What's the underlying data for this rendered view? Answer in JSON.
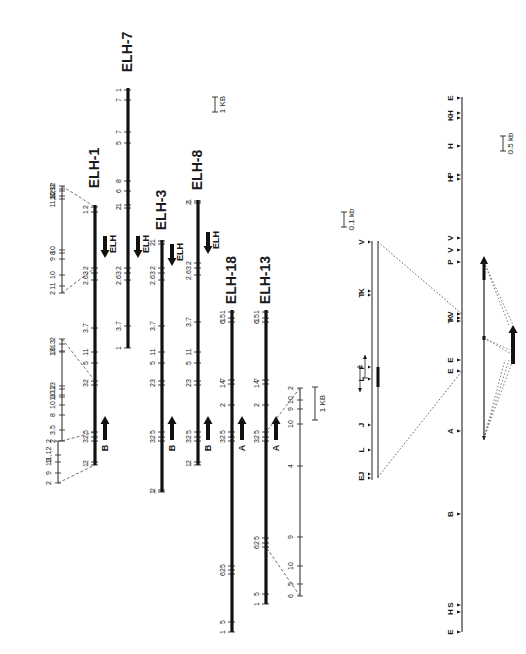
{
  "clones": [
    {
      "name": "ELH-1",
      "x": 95,
      "y1": 205,
      "y2": 465,
      "label_y": 168,
      "ticks": [
        {
          "y": 207,
          "t": "2"
        },
        {
          "y": 212,
          "t": "1"
        },
        {
          "y": 268,
          "t": "2"
        },
        {
          "y": 273,
          "t": "3"
        },
        {
          "y": 280,
          "t": "2.6"
        },
        {
          "y": 328,
          "t": "3.7"
        },
        {
          "y": 352,
          "t": "11"
        },
        {
          "y": 363,
          "t": "5"
        },
        {
          "y": 381,
          "t": "2"
        },
        {
          "y": 385,
          "t": "3"
        },
        {
          "y": 432,
          "t": "5"
        },
        {
          "y": 437,
          "t": "2"
        },
        {
          "y": 441,
          "t": "3"
        },
        {
          "y": 462,
          "t": "2"
        },
        {
          "y": 465,
          "t": "1"
        }
      ],
      "arrows": [
        {
          "y": 236,
          "label": "ELH",
          "dir": "down"
        },
        {
          "y": 438,
          "label": "B",
          "dir": "up"
        }
      ]
    },
    {
      "name": "ELH-7",
      "x": 128,
      "y1": 88,
      "y2": 348,
      "label_y": 52,
      "ticks": [
        {
          "y": 90,
          "t": "1"
        },
        {
          "y": 100,
          "t": "7"
        },
        {
          "y": 132,
          "t": "7"
        },
        {
          "y": 143,
          "t": "5"
        },
        {
          "y": 181,
          "t": "8"
        },
        {
          "y": 191,
          "t": "6"
        },
        {
          "y": 205,
          "t": "1"
        },
        {
          "y": 208,
          "t": "2"
        },
        {
          "y": 268,
          "t": "2"
        },
        {
          "y": 273,
          "t": "3"
        },
        {
          "y": 280,
          "t": "2.6"
        },
        {
          "y": 326,
          "t": "3.7"
        },
        {
          "y": 348,
          "t": "1"
        }
      ],
      "arrows": [
        {
          "y": 236,
          "label": "ELH",
          "dir": "down"
        }
      ]
    },
    {
      "name": "ELH-3",
      "x": 162,
      "y1": 240,
      "y2": 492,
      "label_y": 210,
      "ticks": [
        {
          "y": 241,
          "t": "1"
        },
        {
          "y": 244,
          "t": "2"
        },
        {
          "y": 268,
          "t": "2"
        },
        {
          "y": 273,
          "t": "3"
        },
        {
          "y": 280,
          "t": "2.6"
        },
        {
          "y": 326,
          "t": "3.7"
        },
        {
          "y": 352,
          "t": "11"
        },
        {
          "y": 363,
          "t": "5"
        },
        {
          "y": 381,
          "t": "3"
        },
        {
          "y": 385,
          "t": "2"
        },
        {
          "y": 432,
          "t": "5"
        },
        {
          "y": 437,
          "t": "2"
        },
        {
          "y": 441,
          "t": "3"
        },
        {
          "y": 490,
          "t": "2"
        },
        {
          "y": 492,
          "t": "1"
        }
      ],
      "arrows": [
        {
          "y": 244,
          "label": "ELH",
          "dir": "down"
        },
        {
          "y": 438,
          "label": "B",
          "dir": "up"
        }
      ]
    },
    {
      "name": "ELH-8",
      "x": 198,
      "y1": 200,
      "y2": 465,
      "label_y": 170,
      "ticks": [
        {
          "y": 201,
          "t": "1"
        },
        {
          "y": 203,
          "t": "2"
        },
        {
          "y": 263,
          "t": "2"
        },
        {
          "y": 268,
          "t": "3"
        },
        {
          "y": 275,
          "t": "2.6"
        },
        {
          "y": 322,
          "t": "3.7"
        },
        {
          "y": 352,
          "t": "11"
        },
        {
          "y": 363,
          "t": "5"
        },
        {
          "y": 381,
          "t": "3"
        },
        {
          "y": 385,
          "t": "2"
        },
        {
          "y": 432,
          "t": "5"
        },
        {
          "y": 437,
          "t": "2"
        },
        {
          "y": 441,
          "t": "3"
        },
        {
          "y": 462,
          "t": "2"
        },
        {
          "y": 465,
          "t": "1"
        }
      ],
      "arrows": [
        {
          "y": 232,
          "label": "ELH",
          "dir": "down"
        },
        {
          "y": 438,
          "label": "B",
          "dir": "up"
        }
      ]
    },
    {
      "name": "ELH-18",
      "x": 232,
      "y1": 310,
      "y2": 632,
      "label_y": 280,
      "ticks": [
        {
          "y": 312,
          "t": "1"
        },
        {
          "y": 318,
          "t": "15"
        },
        {
          "y": 322,
          "t": "6"
        },
        {
          "y": 380,
          "t": "7"
        },
        {
          "y": 384,
          "t": "14"
        },
        {
          "y": 405,
          "t": "2"
        },
        {
          "y": 432,
          "t": "5"
        },
        {
          "y": 437,
          "t": "2"
        },
        {
          "y": 441,
          "t": "3"
        },
        {
          "y": 566,
          "t": "5"
        },
        {
          "y": 570,
          "t": "2"
        },
        {
          "y": 574,
          "t": "6"
        },
        {
          "y": 622,
          "t": "5"
        },
        {
          "y": 632,
          "t": "1"
        }
      ],
      "arrows": [
        {
          "y": 438,
          "label": "A",
          "dir": "up"
        }
      ]
    },
    {
      "name": "ELH-13",
      "x": 266,
      "y1": 310,
      "y2": 604,
      "label_y": 280,
      "ticks": [
        {
          "y": 312,
          "t": "1"
        },
        {
          "y": 318,
          "t": "15"
        },
        {
          "y": 322,
          "t": "6"
        },
        {
          "y": 380,
          "t": "7"
        },
        {
          "y": 384,
          "t": "14"
        },
        {
          "y": 405,
          "t": "2"
        },
        {
          "y": 432,
          "t": "5"
        },
        {
          "y": 437,
          "t": "2"
        },
        {
          "y": 441,
          "t": "3"
        },
        {
          "y": 538,
          "t": "5"
        },
        {
          "y": 543,
          "t": "2"
        },
        {
          "y": 547,
          "t": "6"
        },
        {
          "y": 594,
          "t": "5"
        },
        {
          "y": 604,
          "t": "1"
        }
      ],
      "arrows": [
        {
          "y": 438,
          "label": "A",
          "dir": "up"
        }
      ]
    }
  ],
  "expansions": [
    {
      "name": "ELH-1-top-expansion",
      "x": 62,
      "y1": 186,
      "y2": 293,
      "ticks": [
        {
          "y": 186,
          "t": "2"
        },
        {
          "y": 189,
          "t": "9"
        },
        {
          "y": 191,
          "t": "11,12"
        },
        {
          "y": 196,
          "t": "10"
        },
        {
          "y": 199,
          "t": "11,12"
        },
        {
          "y": 250,
          "t": "10"
        },
        {
          "y": 253,
          "t": "8"
        },
        {
          "y": 259,
          "t": "9"
        },
        {
          "y": 275,
          "t": "10"
        },
        {
          "y": 286,
          "t": "11"
        },
        {
          "y": 293,
          "t": "2"
        }
      ],
      "links": [
        [
          186,
          95,
          207
        ],
        [
          293,
          95,
          268
        ]
      ]
    },
    {
      "name": "ELH-1-bottom-expansion-a",
      "x": 62,
      "y1": 339,
      "y2": 441,
      "ticks": [
        {
          "y": 339,
          "t": "2"
        },
        {
          "y": 344,
          "t": "13"
        },
        {
          "y": 351,
          "t": "10"
        },
        {
          "y": 352,
          "t": "13"
        },
        {
          "y": 386,
          "t": "13"
        },
        {
          "y": 389,
          "t": "12"
        },
        {
          "y": 395,
          "t": "10"
        },
        {
          "y": 397,
          "t": "11"
        },
        {
          "y": 405,
          "t": "10"
        },
        {
          "y": 415,
          "t": "8"
        },
        {
          "y": 430,
          "t": "3.5"
        },
        {
          "y": 441,
          "t": "2"
        }
      ],
      "links": [
        [
          339,
          95,
          381
        ],
        [
          441,
          95,
          432
        ]
      ]
    },
    {
      "name": "ELH-1-bottom-expansion-b",
      "x": 58,
      "y1": 441,
      "y2": 483,
      "ticks": [
        {
          "y": 441,
          "t": "2"
        },
        {
          "y": 455,
          "t": "11,12"
        },
        {
          "y": 462,
          "t": "13"
        },
        {
          "y": 473,
          "t": "9"
        },
        {
          "y": 483,
          "t": "2"
        }
      ],
      "links": [
        [
          483,
          95,
          465
        ]
      ]
    },
    {
      "name": "ELH-13-expansion",
      "x": 300,
      "y1": 388,
      "y2": 596,
      "ticks": [
        {
          "y": 388,
          "t": "2"
        },
        {
          "y": 400,
          "t": "10"
        },
        {
          "y": 409,
          "t": "9"
        },
        {
          "y": 424,
          "t": "10"
        },
        {
          "y": 466,
          "t": "4"
        },
        {
          "y": 537,
          "t": "9"
        },
        {
          "y": 566,
          "t": "10"
        },
        {
          "y": 584,
          "t": "5"
        },
        {
          "y": 596,
          "t": "6"
        }
      ],
      "links": [
        [
          388,
          266,
          432
        ],
        [
          596,
          266,
          547
        ]
      ]
    }
  ],
  "scale_bars": [
    {
      "label": "1 KB",
      "x": 215,
      "y1": 97,
      "y2": 112
    },
    {
      "label": "1 KB",
      "x": 315,
      "y1": 387,
      "y2": 420
    },
    {
      "label": "0.1 kb",
      "x": 344,
      "y1": 212,
      "y2": 227
    },
    {
      "label": "0.5 kb",
      "x": 503,
      "y1": 136,
      "y2": 151
    }
  ],
  "restriction_map": {
    "x": 462,
    "y1": 97,
    "y2": 632,
    "sites": [
      {
        "y": 98,
        "t": "E"
      },
      {
        "y": 113,
        "t": "H"
      },
      {
        "y": 118,
        "t": "K"
      },
      {
        "y": 146,
        "t": "H"
      },
      {
        "y": 175,
        "t": "P"
      },
      {
        "y": 179,
        "t": "H"
      },
      {
        "y": 238,
        "t": "V"
      },
      {
        "y": 250,
        "t": "V"
      },
      {
        "y": 262,
        "t": "P"
      },
      {
        "y": 314,
        "t": "V"
      },
      {
        "y": 318,
        "t": "K"
      },
      {
        "y": 321,
        "t": "T"
      },
      {
        "y": 360,
        "t": "E"
      },
      {
        "y": 371,
        "t": "E"
      },
      {
        "y": 431,
        "t": "A"
      },
      {
        "y": 514,
        "t": "B"
      },
      {
        "y": 605,
        "t": "S"
      },
      {
        "y": 612,
        "t": "H"
      },
      {
        "y": 632,
        "t": "E"
      }
    ]
  },
  "fine_map": {
    "x": 372,
    "x2": 378,
    "y1": 241,
    "y2": 480,
    "sites": [
      {
        "y": 242,
        "t": "V"
      },
      {
        "y": 291,
        "t": "K"
      },
      {
        "y": 295,
        "t": "T"
      },
      {
        "y": 367,
        "t": "F"
      },
      {
        "y": 379,
        "t": "L"
      },
      {
        "y": 425,
        "t": "J"
      },
      {
        "y": 450,
        "t": "L"
      },
      {
        "y": 474,
        "t": "J"
      },
      {
        "y": 478,
        "t": "E"
      }
    ],
    "segment": {
      "y1": 367,
      "y2": 387
    },
    "orf_arrows": [
      {
        "x": 360,
        "y1": 367,
        "y2": 392,
        "dir": "down"
      },
      {
        "x": 365,
        "y1": 355,
        "y2": 378,
        "dir": "up"
      }
    ],
    "links": [
      [
        378,
        242,
        462,
        314
      ],
      [
        378,
        477,
        462,
        371
      ]
    ]
  },
  "transcripts": {
    "long": {
      "x": 484,
      "y1": 256,
      "y2": 440,
      "tip": "up"
    },
    "short": {
      "x": 513,
      "y1": 325,
      "y2": 360,
      "tip": "up"
    },
    "links": [
      [
        484,
        262,
        513,
        325
      ],
      [
        484,
        262,
        509,
        325
      ],
      [
        484,
        338,
        513,
        355
      ],
      [
        484,
        338,
        510,
        350
      ],
      [
        484,
        438,
        513,
        360
      ],
      [
        484,
        438,
        509,
        360
      ],
      [
        484,
        438,
        505,
        360
      ]
    ]
  }
}
